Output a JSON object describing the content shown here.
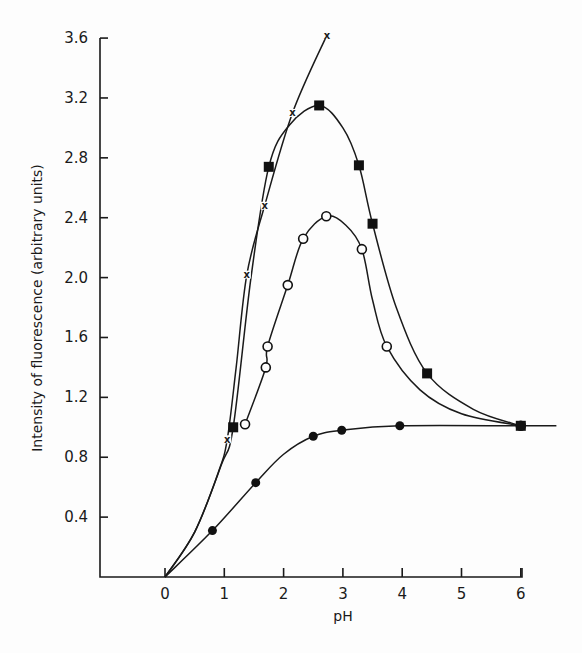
{
  "chart_data": {
    "type": "line",
    "title": "",
    "xlabel": "pH",
    "ylabel": "Intensity of fluorescence (arbitrary units)",
    "xlim": [
      -1.1,
      6.7
    ],
    "ylim": [
      0,
      3.6
    ],
    "x_ticks": [
      0,
      1,
      2,
      3,
      4,
      5,
      6
    ],
    "x_tick_labels": [
      "0",
      "1",
      "2",
      "3",
      "4",
      "5",
      "6"
    ],
    "y_ticks": [
      0.4,
      0.8,
      1.2,
      1.6,
      2.0,
      2.4,
      2.8,
      3.2,
      3.6
    ],
    "y_tick_labels": [
      "0.4",
      "0.8",
      "1.2",
      "1.6",
      "2.0",
      "2.4",
      "2.8",
      "3.2",
      "3.6"
    ],
    "grid": false,
    "legend": null,
    "series": [
      {
        "name": "crosses",
        "marker": "x",
        "points": [
          [
            1.05,
            0.92
          ],
          [
            1.38,
            2.02
          ],
          [
            1.68,
            2.48
          ],
          [
            2.15,
            3.1
          ],
          [
            2.73,
            3.62
          ]
        ],
        "curve": [
          [
            0,
            0
          ],
          [
            0.5,
            0.3
          ],
          [
            0.9,
            0.7
          ],
          [
            1.05,
            0.92
          ],
          [
            1.2,
            1.4
          ],
          [
            1.38,
            2.02
          ],
          [
            1.68,
            2.48
          ],
          [
            2.15,
            3.1
          ],
          [
            2.73,
            3.62
          ]
        ]
      },
      {
        "name": "filled squares",
        "marker": "filled-square",
        "points": [
          [
            1.15,
            1.0
          ],
          [
            1.75,
            2.74
          ],
          [
            2.6,
            3.15
          ],
          [
            3.27,
            2.75
          ],
          [
            3.5,
            2.36
          ],
          [
            4.42,
            1.36
          ],
          [
            6.0,
            1.01
          ]
        ],
        "curve": [
          [
            0,
            0
          ],
          [
            0.5,
            0.3
          ],
          [
            0.95,
            0.75
          ],
          [
            1.15,
            1.0
          ],
          [
            1.45,
            2.0
          ],
          [
            1.75,
            2.74
          ],
          [
            2.1,
            3.02
          ],
          [
            2.6,
            3.15
          ],
          [
            3.0,
            3.0
          ],
          [
            3.27,
            2.75
          ],
          [
            3.5,
            2.36
          ],
          [
            3.9,
            1.8
          ],
          [
            4.42,
            1.36
          ],
          [
            5.2,
            1.12
          ],
          [
            6.0,
            1.01
          ]
        ]
      },
      {
        "name": "open circles",
        "marker": "open-circle",
        "points": [
          [
            1.35,
            1.02
          ],
          [
            1.7,
            1.4
          ],
          [
            1.73,
            1.54
          ],
          [
            2.07,
            1.95
          ],
          [
            2.33,
            2.26
          ],
          [
            2.72,
            2.41
          ],
          [
            3.32,
            2.19
          ],
          [
            3.74,
            1.54
          ],
          [
            6.0,
            1.01
          ]
        ],
        "curve": [
          [
            1.35,
            1.02
          ],
          [
            1.7,
            1.4
          ],
          [
            1.73,
            1.54
          ],
          [
            2.07,
            1.95
          ],
          [
            2.33,
            2.26
          ],
          [
            2.72,
            2.41
          ],
          [
            3.05,
            2.35
          ],
          [
            3.32,
            2.19
          ],
          [
            3.5,
            1.85
          ],
          [
            3.74,
            1.54
          ],
          [
            4.3,
            1.25
          ],
          [
            5.0,
            1.09
          ],
          [
            6.0,
            1.01
          ]
        ]
      },
      {
        "name": "filled circles",
        "marker": "filled-circle",
        "points": [
          [
            0.8,
            0.31
          ],
          [
            1.53,
            0.63
          ],
          [
            2.5,
            0.94
          ],
          [
            2.98,
            0.98
          ],
          [
            3.96,
            1.01
          ],
          [
            6.0,
            1.01
          ]
        ],
        "curve": [
          [
            0,
            0
          ],
          [
            0.8,
            0.31
          ],
          [
            1.53,
            0.63
          ],
          [
            2.0,
            0.82
          ],
          [
            2.5,
            0.94
          ],
          [
            2.98,
            0.98
          ],
          [
            3.96,
            1.01
          ],
          [
            6.0,
            1.01
          ],
          [
            6.6,
            1.01
          ]
        ]
      }
    ]
  }
}
